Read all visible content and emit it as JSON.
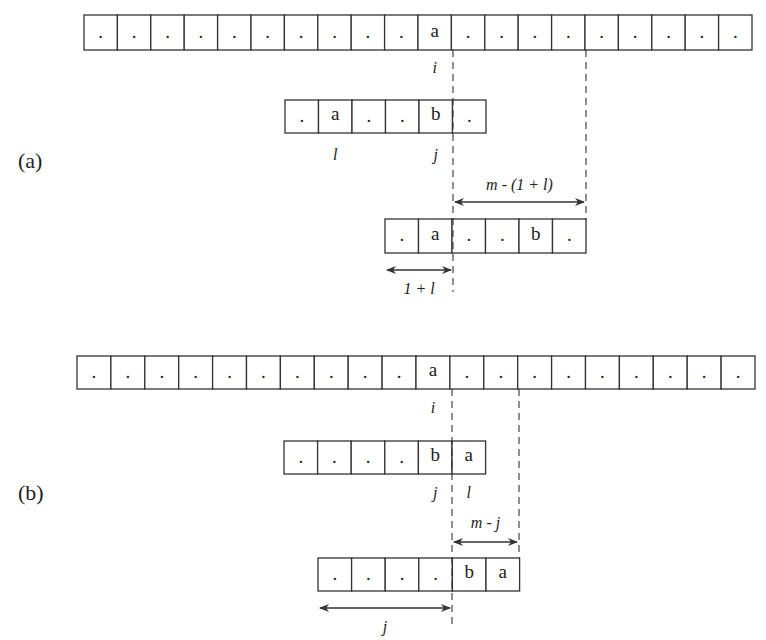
{
  "parts": [
    {
      "label": "(a)",
      "text_row": [
        "·",
        "·",
        "·",
        "·",
        "·",
        "·",
        "·",
        "·",
        "·",
        "·",
        "a",
        "·",
        "·",
        "·",
        "·",
        "·",
        "·",
        "·",
        "·",
        "·"
      ],
      "text_index_label": "i",
      "pattern_row": [
        "·",
        "a",
        "·",
        "·",
        "b",
        "·"
      ],
      "pattern_labels": [
        {
          "cell": 1,
          "text": "l"
        },
        {
          "cell": 4,
          "text": "j"
        }
      ],
      "shifted_pattern_row": [
        "·",
        "a",
        "·",
        "·",
        "b",
        "·"
      ],
      "shift_arrow_label": "m - (1 + l)",
      "offset_arrow_label": "1 + l"
    },
    {
      "label": "(b)",
      "text_row": [
        "·",
        "·",
        "·",
        "·",
        "·",
        "·",
        "·",
        "·",
        "·",
        "·",
        "a",
        "·",
        "·",
        "·",
        "·",
        "·",
        "·",
        "·",
        "·",
        "·"
      ],
      "text_index_label": "i",
      "pattern_row": [
        "·",
        "·",
        "·",
        "·",
        "b",
        "a"
      ],
      "pattern_labels": [
        {
          "cell": 4,
          "text": "j"
        },
        {
          "cell": 5,
          "text": "l"
        }
      ],
      "shifted_pattern_row": [
        "·",
        "·",
        "·",
        "·",
        "b",
        "a"
      ],
      "shift_arrow_label": "m - j",
      "offset_arrow_label": "j"
    }
  ]
}
